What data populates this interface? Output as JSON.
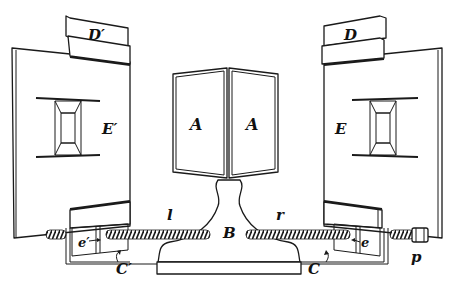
{
  "figure": {
    "type": "apparatus diagram",
    "labels": {
      "D_prime": "D′",
      "D": "D",
      "E_prime": "E′",
      "E": "E",
      "A_left": "A",
      "A_right": "A",
      "B": "B",
      "l": "l",
      "r": "r",
      "e_prime": "e′",
      "e": "e",
      "C_prime": "C′",
      "C": "C",
      "p": "p"
    },
    "colors": {
      "ink": "#1a1a1a",
      "paper": "#ffffff"
    }
  }
}
